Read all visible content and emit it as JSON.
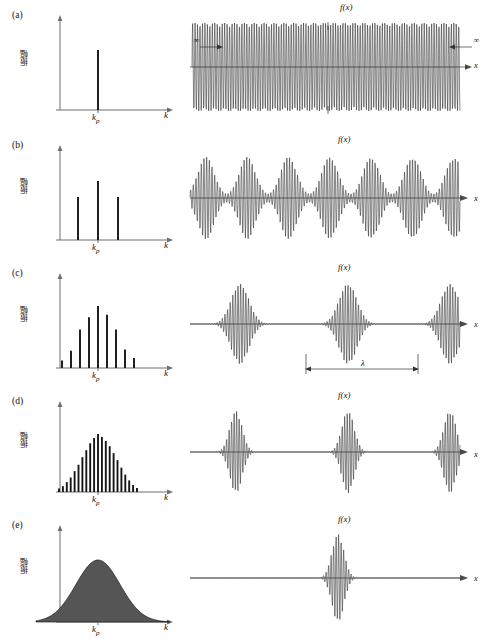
{
  "figure": {
    "y_axis_label": "振幅",
    "k_axis_label": "k",
    "k_peak_label": "k",
    "k_peak_sub": "p",
    "x_axis_label": "x",
    "function_label": "f(x)",
    "infinity_label": "∞",
    "wavelength_label": "λ",
    "accent": "#151515",
    "axis_color": "#6f6f6f",
    "wave_color": "#262626"
  },
  "panels": [
    {
      "label": "(a)",
      "spectrum_kind": "bars",
      "right_kind": "continuous",
      "packets": 0,
      "has_infinity_arrows": true,
      "has_wavelength_marker": false
    },
    {
      "label": "(b)",
      "spectrum_kind": "bars",
      "right_kind": "packets",
      "packets": 7,
      "has_infinity_arrows": false,
      "has_wavelength_marker": false
    },
    {
      "label": "(c)",
      "spectrum_kind": "bars",
      "right_kind": "packets",
      "packets": 3,
      "has_infinity_arrows": false,
      "has_wavelength_marker": true
    },
    {
      "label": "(d)",
      "spectrum_kind": "bars",
      "right_kind": "packets",
      "packets": 3,
      "has_infinity_arrows": false,
      "has_wavelength_marker": false
    },
    {
      "label": "(e)",
      "spectrum_kind": "continuous-gaussian",
      "right_kind": "single-packet",
      "packets": 1,
      "has_infinity_arrows": false,
      "has_wavelength_marker": false
    }
  ],
  "chart_data": {
    "type": "bar",
    "title": "",
    "xlabel": "k",
    "ylabel": "振幅",
    "panels": [
      {
        "id": "a",
        "label": "(a)",
        "left_chart": {
          "type": "bar",
          "xlabel": "k",
          "ylabel": "振幅",
          "categories": [
            "k_p"
          ],
          "values": [
            1.0
          ],
          "n_components": 1,
          "note": "single monochromatic component at k_p"
        },
        "right_chart": {
          "type": "line",
          "xlabel": "x",
          "ylabel": "f(x)",
          "waveform": "infinite uniform sinusoid",
          "envelope": "constant",
          "packets": 0,
          "annotations": [
            "∞",
            "∞"
          ]
        }
      },
      {
        "id": "b",
        "label": "(b)",
        "left_chart": {
          "type": "bar",
          "xlabel": "k",
          "ylabel": "振幅",
          "categories": [
            "k_p-Δk",
            "k_p",
            "k_p+Δk"
          ],
          "values": [
            0.62,
            1.0,
            0.62
          ],
          "n_components": 3
        },
        "right_chart": {
          "type": "line",
          "xlabel": "x",
          "ylabel": "f(x)",
          "waveform": "beat pattern / periodic wave groups",
          "packets": 7
        }
      },
      {
        "id": "c",
        "label": "(c)",
        "left_chart": {
          "type": "bar",
          "xlabel": "k",
          "ylabel": "振幅",
          "values": [
            0.12,
            0.28,
            0.62,
            0.82,
            1.0,
            0.86,
            0.62,
            0.3,
            0.16
          ],
          "n_components": 9,
          "peak_index": 4,
          "envelope": "gaussian"
        },
        "right_chart": {
          "type": "line",
          "xlabel": "x",
          "ylabel": "f(x)",
          "waveform": "separated wave packets",
          "packets": 3,
          "annotations": [
            "λ"
          ]
        }
      },
      {
        "id": "d",
        "label": "(d)",
        "left_chart": {
          "type": "bar",
          "xlabel": "k",
          "ylabel": "振幅",
          "values": [
            0.06,
            0.1,
            0.17,
            0.25,
            0.36,
            0.47,
            0.6,
            0.72,
            0.84,
            0.93,
            1.0,
            0.95,
            0.88,
            0.79,
            0.67,
            0.55,
            0.42,
            0.3,
            0.2,
            0.12,
            0.07
          ],
          "n_components": 21,
          "peak_index": 10,
          "envelope": "gaussian"
        },
        "right_chart": {
          "type": "line",
          "xlabel": "x",
          "ylabel": "f(x)",
          "waveform": "widely separated narrow wave packets",
          "packets": 3
        }
      },
      {
        "id": "e",
        "label": "(e)",
        "left_chart": {
          "type": "area",
          "xlabel": "k",
          "ylabel": "振幅",
          "envelope": "continuous gaussian",
          "peak_at": "k_p",
          "n_components": "continuum",
          "filled": true
        },
        "right_chart": {
          "type": "line",
          "xlabel": "x",
          "ylabel": "f(x)",
          "waveform": "single localized wave packet",
          "packets": 1
        }
      }
    ]
  }
}
